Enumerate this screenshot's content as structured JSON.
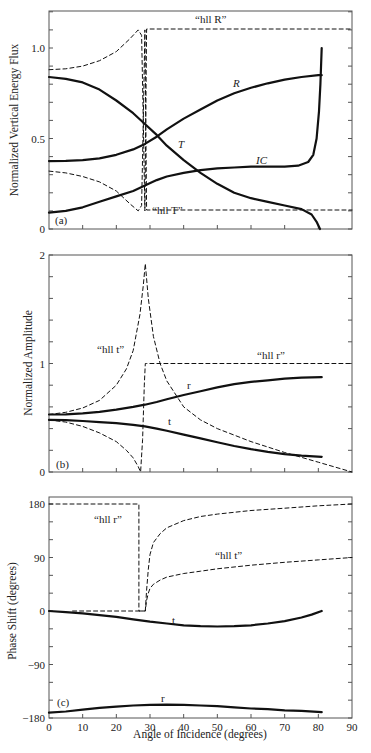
{
  "figure": {
    "xlabel": "Angle of Incidence (degrees)",
    "xticks": [
      "0",
      "10",
      "20",
      "30",
      "40",
      "50",
      "60",
      "70",
      "80",
      "90"
    ]
  },
  "chart_data": [
    {
      "type": "line",
      "panel": "(a)",
      "title": "",
      "xlabel": "Angle of Incidence (degrees)",
      "ylabel": "Normalized Vertical Energy Flux",
      "xlim": [
        0,
        90
      ],
      "ylim": [
        0,
        1.2
      ],
      "yticks_labeled": [
        "0",
        "0.5",
        "1.0"
      ],
      "ytick_minor_step": 0.1,
      "grid": false,
      "series": [
        {
          "name": "R",
          "style": "solid",
          "label": "R",
          "x": [
            0,
            5,
            10,
            15,
            20,
            25,
            28.5,
            32,
            35,
            40,
            45,
            50,
            55,
            60,
            65,
            70,
            75,
            80,
            81
          ],
          "y": [
            0.375,
            0.376,
            0.38,
            0.39,
            0.41,
            0.44,
            0.47,
            0.51,
            0.55,
            0.61,
            0.66,
            0.71,
            0.75,
            0.78,
            0.805,
            0.825,
            0.84,
            0.85,
            0.85
          ]
        },
        {
          "name": "T",
          "style": "solid",
          "label": "T",
          "x": [
            0,
            5,
            10,
            15,
            20,
            25,
            28.5,
            32,
            35,
            40,
            45,
            50,
            55,
            60,
            65,
            70,
            75,
            78,
            79.5,
            80.5
          ],
          "y": [
            0.84,
            0.83,
            0.81,
            0.77,
            0.71,
            0.64,
            0.58,
            0.52,
            0.46,
            0.38,
            0.31,
            0.25,
            0.2,
            0.17,
            0.15,
            0.13,
            0.11,
            0.08,
            0.04,
            0.0
          ]
        },
        {
          "name": "IC",
          "style": "solid",
          "label": "IC",
          "x": [
            0,
            5,
            10,
            15,
            20,
            25,
            28.5,
            32,
            35,
            40,
            45,
            50,
            55,
            60,
            65,
            70,
            74,
            77,
            78.5,
            79.5,
            80.2,
            80.6,
            81
          ],
          "y": [
            0.09,
            0.1,
            0.12,
            0.15,
            0.18,
            0.21,
            0.24,
            0.27,
            0.29,
            0.31,
            0.325,
            0.335,
            0.34,
            0.345,
            0.345,
            0.345,
            0.35,
            0.37,
            0.41,
            0.5,
            0.65,
            0.8,
            1.0
          ]
        },
        {
          "name": "hll R",
          "style": "dashed",
          "label": "“hll R”",
          "x": [
            0,
            5,
            10,
            15,
            20,
            24,
            26.5,
            27.5,
            28.0,
            28.5,
            29.0,
            90
          ],
          "y": [
            0.88,
            0.885,
            0.9,
            0.93,
            0.98,
            1.05,
            1.1,
            1.07,
            0.6,
            0.1,
            1.105,
            1.105
          ]
        },
        {
          "name": "hll T",
          "style": "dashed",
          "label": "“hll T”",
          "x": [
            0,
            5,
            10,
            15,
            20,
            24,
            26.5,
            27.5,
            28.0,
            28.5,
            29.0,
            90
          ],
          "y": [
            0.32,
            0.31,
            0.29,
            0.26,
            0.21,
            0.14,
            0.1,
            0.13,
            0.6,
            1.1,
            0.105,
            0.105
          ]
        }
      ]
    },
    {
      "type": "line",
      "panel": "(b)",
      "title": "",
      "xlabel": "Angle of Incidence (degrees)",
      "ylabel": "Normalized Amplitude",
      "xlim": [
        0,
        90
      ],
      "ylim": [
        0,
        2
      ],
      "yticks_labeled": [
        "0",
        "1",
        "2"
      ],
      "ytick_minor_step": 0.2,
      "grid": false,
      "series": [
        {
          "name": "r",
          "style": "solid",
          "label": "r",
          "x": [
            0,
            5,
            10,
            15,
            20,
            25,
            28.5,
            32,
            35,
            40,
            45,
            50,
            55,
            60,
            65,
            70,
            75,
            81
          ],
          "y": [
            0.53,
            0.532,
            0.54,
            0.555,
            0.575,
            0.6,
            0.62,
            0.645,
            0.67,
            0.71,
            0.745,
            0.78,
            0.81,
            0.83,
            0.845,
            0.86,
            0.87,
            0.875
          ]
        },
        {
          "name": "t",
          "style": "solid",
          "label": "t",
          "x": [
            0,
            5,
            10,
            15,
            20,
            25,
            28.5,
            32,
            35,
            40,
            45,
            50,
            55,
            60,
            65,
            70,
            75,
            81
          ],
          "y": [
            0.48,
            0.478,
            0.47,
            0.46,
            0.45,
            0.435,
            0.42,
            0.4,
            0.38,
            0.345,
            0.31,
            0.275,
            0.24,
            0.21,
            0.185,
            0.165,
            0.15,
            0.14
          ]
        },
        {
          "name": "hll t",
          "style": "dashed",
          "label": "“hll t”",
          "x": [
            0,
            5,
            10,
            15,
            20,
            23,
            25,
            27,
            28,
            28.6,
            29.5,
            31,
            33,
            35,
            40,
            45,
            50,
            60,
            70,
            80,
            90
          ],
          "y": [
            0.53,
            0.55,
            0.59,
            0.66,
            0.8,
            0.95,
            1.12,
            1.45,
            1.72,
            1.92,
            1.6,
            1.25,
            1.0,
            0.84,
            0.6,
            0.48,
            0.4,
            0.28,
            0.18,
            0.09,
            0.0
          ]
        },
        {
          "name": "hll r",
          "style": "dashed",
          "label": "“hll r”",
          "x": [
            0,
            5,
            10,
            15,
            20,
            23,
            25,
            26.5,
            27.2,
            27.8,
            28.3,
            28.6,
            29,
            90
          ],
          "y": [
            0.48,
            0.46,
            0.42,
            0.36,
            0.28,
            0.2,
            0.13,
            0.05,
            0.0,
            0.3,
            0.8,
            1.0,
            1.0,
            1.0
          ]
        }
      ]
    },
    {
      "type": "line",
      "panel": "(c)",
      "title": "",
      "xlabel": "Angle of Incidence (degrees)",
      "ylabel": "Phase Shift (degrees)",
      "xlim": [
        0,
        90
      ],
      "ylim": [
        -180,
        180
      ],
      "yticks_labeled": [
        "-180",
        "-90",
        "0",
        "90",
        "180"
      ],
      "ytick_minor_step": 30,
      "grid": false,
      "series": [
        {
          "name": "t",
          "style": "solid",
          "label": "t",
          "x": [
            0,
            5,
            10,
            15,
            20,
            25,
            30,
            35,
            40,
            45,
            50,
            55,
            60,
            65,
            70,
            75,
            78,
            81
          ],
          "y": [
            0,
            -2,
            -4,
            -7,
            -10,
            -14,
            -18,
            -21,
            -24,
            -25.5,
            -26,
            -25.5,
            -24,
            -21,
            -17,
            -11,
            -6,
            0
          ]
        },
        {
          "name": "r",
          "style": "solid",
          "label": "r",
          "x": [
            0,
            5,
            10,
            15,
            20,
            25,
            30,
            35,
            40,
            45,
            50,
            55,
            60,
            65,
            70,
            75,
            81
          ],
          "y": [
            -171,
            -169,
            -166,
            -163,
            -161,
            -159,
            -158,
            -157.5,
            -158,
            -159,
            -160,
            -162,
            -164,
            -165,
            -167,
            -168,
            -170
          ]
        },
        {
          "name": "hll r",
          "style": "dashed",
          "label": "“hll r”",
          "x": [
            0,
            26.7,
            26.7,
            28.6,
            29.0,
            29.5,
            30,
            31,
            33,
            35,
            40,
            45,
            50,
            60,
            70,
            80,
            90
          ],
          "y": [
            180,
            180,
            0,
            0,
            35,
            70,
            95,
            115,
            130,
            140,
            152,
            159,
            163,
            169,
            173,
            177,
            180
          ]
        },
        {
          "name": "hll t",
          "style": "dashed",
          "label": "“hll t”",
          "x": [
            7,
            26.7,
            28.6,
            29.0,
            29.5,
            30,
            31,
            33,
            35,
            40,
            45,
            50,
            60,
            70,
            80,
            90
          ],
          "y": [
            0,
            0,
            0,
            18,
            30,
            38,
            45,
            52,
            57,
            63,
            67,
            71,
            77,
            82,
            86,
            90
          ]
        }
      ]
    }
  ],
  "panels": {
    "a": {
      "tag": "(a)",
      "ylabel": "Normalized Vertical Energy Flux",
      "yticks": [
        {
          "v": 0,
          "label": "0"
        },
        {
          "v": 0.5,
          "label": "0.5"
        },
        {
          "v": 1.0,
          "label": "1.0"
        }
      ],
      "labels": {
        "hllR": "“hll R”",
        "hllT": "“hll T”",
        "R": "R",
        "T": "T",
        "IC": "IC"
      }
    },
    "b": {
      "tag": "(b)",
      "ylabel": "Normalized Amplitude",
      "yticks": [
        {
          "v": 0,
          "label": "0"
        },
        {
          "v": 1,
          "label": "1"
        },
        {
          "v": 2,
          "label": "2"
        }
      ],
      "labels": {
        "hllt": "“hll t”",
        "hllr": "“hll r”",
        "r": "r",
        "t": "t"
      }
    },
    "c": {
      "tag": "(c)",
      "ylabel": "Phase Shift (degrees)",
      "yticks": [
        {
          "v": 180,
          "label": "180"
        },
        {
          "v": 90,
          "label": "90"
        },
        {
          "v": 0,
          "label": "0"
        },
        {
          "v": -90,
          "label": "−90"
        },
        {
          "v": -180,
          "label": "−180"
        }
      ],
      "labels": {
        "hllr": "“hll r”",
        "hllt": "“hll t”",
        "r": "r",
        "t": "t"
      }
    }
  }
}
